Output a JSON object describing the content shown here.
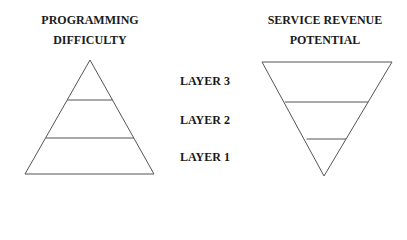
{
  "left_diagram": {
    "title_line1": "PROGRAMMING",
    "title_line2": "DIFFICULTY",
    "shape": "upright-triangle",
    "layers": 3
  },
  "right_diagram": {
    "title_line1": "SERVICE REVENUE",
    "title_line2": "POTENTIAL",
    "shape": "inverted-triangle",
    "layers": 3
  },
  "layer_labels": [
    "LAYER 3",
    "LAYER 2",
    "LAYER 1"
  ],
  "colors": {
    "line": "#555555",
    "text": "#1a1a1a",
    "background": "#ffffff"
  }
}
